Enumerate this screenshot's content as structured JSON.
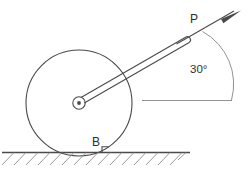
{
  "figure": {
    "labels": {
      "force_label": "P",
      "contact_label": "B",
      "angle_label": "30°"
    },
    "geometry": {
      "wheel_center_x": 79,
      "wheel_center_y": 103,
      "wheel_radius": 53,
      "hub_outer_radius": 6,
      "hub_inner_radius": 2,
      "handle_tip_x": 188,
      "handle_tip_y": 42,
      "arrow_tip_x": 241,
      "arrow_tip_y": 11,
      "ground_line_y": 152,
      "ground_line_x_start": 2,
      "ground_line_x_end": 190,
      "step_height": 6,
      "step_x": 108,
      "reference_line_y": 100,
      "reference_line_x_start": 142,
      "reference_line_x_end": 232,
      "arc_radius": 60,
      "angle_degrees": 30
    },
    "colors": {
      "stroke": "#4a4a4a",
      "thin_stroke": "#777777",
      "hatch": "#8a8a8a",
      "background": "#ffffff",
      "text": "#2e2e2e"
    }
  }
}
